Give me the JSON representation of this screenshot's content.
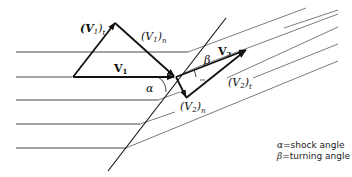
{
  "diagram": {
    "labels": {
      "v1": "V",
      "v1_sub": "1",
      "v1t": "(V",
      "v1t_sub": "1",
      "v1t_close": ")",
      "v1t_subscript2": "t",
      "v1n": "(V",
      "v1n_sub": "1",
      "v1n_close": ")",
      "v1n_subscript2": "n",
      "v2": "V",
      "v2_sub": "2",
      "v2n": "(V",
      "v2n_sub": "2",
      "v2n_close": ")",
      "v2n_subscript2": "n",
      "v2t": "(V",
      "v2t_sub": "2",
      "v2t_close": ")",
      "v2t_subscript2": "t",
      "alpha": "α",
      "beta": "β"
    },
    "legend": [
      {
        "symbol": "α",
        "text": "=shock angle"
      },
      {
        "symbol": "β",
        "text": "=turning angle"
      }
    ]
  }
}
